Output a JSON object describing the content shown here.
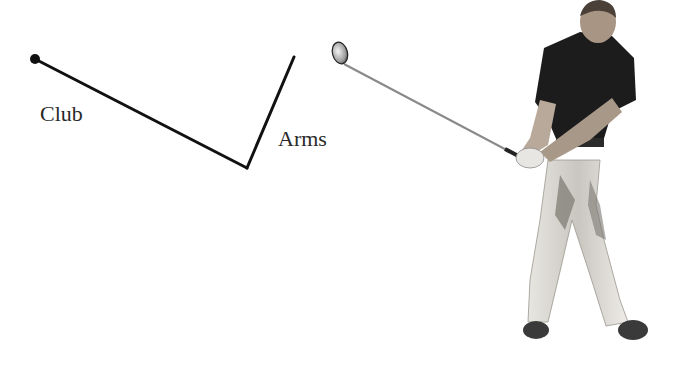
{
  "diagram": {
    "labels": {
      "club": "Club",
      "arms": "Arms"
    },
    "colors": {
      "line": "#111111",
      "text": "#2a2a2a",
      "shirt": "#1c1c1c",
      "pants": "#d6d3cc",
      "pants_shadow": "#6e6b66",
      "skin": "#b8a99a",
      "shaft": "#8a8a8a",
      "background": "#ffffff"
    }
  }
}
